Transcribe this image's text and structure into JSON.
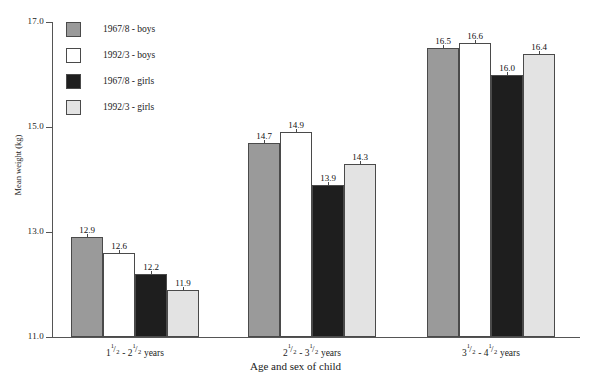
{
  "chart_data": {
    "type": "bar",
    "title": "",
    "xlabel": "Age and sex of child",
    "ylabel": "Mean weight (kg)",
    "ylim": [
      11.0,
      17.0
    ],
    "yticks": [
      "11.0",
      "13.0",
      "15.0",
      "17.0"
    ],
    "ytick_values": [
      11.0,
      13.0,
      15.0,
      17.0
    ],
    "grid": false,
    "legend_position": "upper-left-inside",
    "categories": [
      "1½ - 2½ years",
      "2½ - 3½ years",
      "3½ - 4½ years"
    ],
    "category_parts": [
      {
        "a_whole": "1",
        "a_num": "1",
        "a_den": "2",
        "sep": " - ",
        "b_whole": "2",
        "b_num": "1",
        "b_den": "2",
        "unit": " years"
      },
      {
        "a_whole": "2",
        "a_num": "1",
        "a_den": "2",
        "sep": " - ",
        "b_whole": "3",
        "b_num": "1",
        "b_den": "2",
        "unit": " years"
      },
      {
        "a_whole": "3",
        "a_num": "1",
        "a_den": "2",
        "sep": " - ",
        "b_whole": "4",
        "b_num": "1",
        "b_den": "2",
        "unit": " years"
      }
    ],
    "series": [
      {
        "name": "1967/8 - boys",
        "color": "#9a9a9a",
        "values": [
          12.9,
          14.7,
          16.5
        ],
        "labels": [
          "12.9",
          "14.7",
          "16.5"
        ]
      },
      {
        "name": "1992/3 - boys",
        "color": "#ffffff",
        "values": [
          12.6,
          14.9,
          16.6
        ],
        "labels": [
          "12.6",
          "14.9",
          "16.6"
        ]
      },
      {
        "name": "1967/8 - girls",
        "color": "#1e1e1e",
        "values": [
          12.2,
          13.9,
          16.0
        ],
        "labels": [
          "12.2",
          "13.9",
          "16.0"
        ]
      },
      {
        "name": "1992/3 - girls",
        "color": "#e3e3e3",
        "values": [
          11.9,
          14.3,
          16.4
        ],
        "labels": [
          "11.9",
          "14.3",
          "16.4"
        ]
      }
    ]
  },
  "legend": {
    "items": [
      {
        "label": "1967/8 - boys",
        "color": "#9a9a9a"
      },
      {
        "label": "1992/3 - boys",
        "color": "#ffffff"
      },
      {
        "label": "1967/8 - girls",
        "color": "#1e1e1e"
      },
      {
        "label": "1992/3 - girls",
        "color": "#e3e3e3"
      }
    ]
  }
}
